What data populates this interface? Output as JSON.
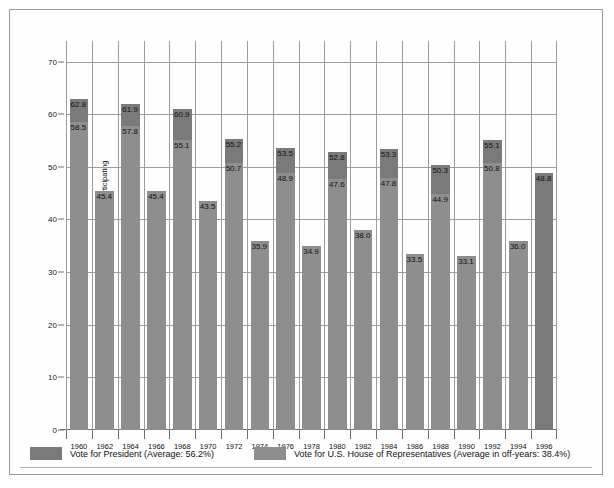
{
  "chart_data": {
    "type": "bar",
    "title": "",
    "xlabel": "",
    "ylabel": "Percentage of voting-age population participating",
    "ylim": [
      0,
      73.9
    ],
    "yticks": [
      0,
      10,
      20,
      30,
      40,
      50,
      60,
      70
    ],
    "grid": "both",
    "legend_position": "bottom-left",
    "categories": [
      "1960",
      "1962",
      "1964",
      "1966",
      "1968",
      "1970",
      "1972",
      "1974",
      "1976",
      "1978",
      "1980",
      "1982",
      "1984",
      "1986",
      "1988",
      "1990",
      "1992",
      "1994",
      "1996"
    ],
    "series": [
      {
        "name": "Vote for President (Average: 56.2%)",
        "color": "#7a7a7a",
        "values": [
          62.8,
          null,
          61.9,
          null,
          60.9,
          null,
          55.2,
          null,
          53.5,
          null,
          52.8,
          null,
          53.3,
          null,
          50.3,
          null,
          55.1,
          null,
          48.8
        ]
      },
      {
        "name": "Vote for U.S. House of Representatives (Average in off-years: 38.4%)",
        "color": "#8e8e8e",
        "values": [
          58.5,
          45.4,
          57.8,
          45.4,
          55.1,
          43.5,
          50.7,
          35.9,
          48.9,
          34.9,
          47.6,
          38.0,
          47.8,
          33.5,
          44.9,
          33.1,
          50.8,
          36.0,
          null
        ]
      }
    ],
    "bars": [
      {
        "year": "1960",
        "president": 62.8,
        "house": 58.5
      },
      {
        "year": "1962",
        "president": null,
        "house": 45.4
      },
      {
        "year": "1964",
        "president": 61.9,
        "house": 57.8
      },
      {
        "year": "1966",
        "president": null,
        "house": 45.4
      },
      {
        "year": "1968",
        "president": 60.9,
        "house": 55.1
      },
      {
        "year": "1970",
        "president": null,
        "house": 43.5
      },
      {
        "year": "1972",
        "president": 55.2,
        "house": 50.7
      },
      {
        "year": "1974",
        "president": null,
        "house": 35.9
      },
      {
        "year": "1976",
        "president": 53.5,
        "house": 48.9
      },
      {
        "year": "1978",
        "president": null,
        "house": 34.9
      },
      {
        "year": "1980",
        "president": 52.8,
        "house": 47.6
      },
      {
        "year": "1982",
        "president": null,
        "house": 38.0
      },
      {
        "year": "1984",
        "president": 53.3,
        "house": 47.8
      },
      {
        "year": "1986",
        "president": null,
        "house": 33.5
      },
      {
        "year": "1988",
        "president": 50.3,
        "house": 44.9
      },
      {
        "year": "1990",
        "president": null,
        "house": 33.1
      },
      {
        "year": "1992",
        "president": 55.1,
        "house": 50.8
      },
      {
        "year": "1994",
        "president": null,
        "house": 36.0
      },
      {
        "year": "1996",
        "president": 48.8,
        "house": null
      }
    ]
  },
  "legend": {
    "items": [
      {
        "label": "Vote for President (Average: 56.2%)",
        "color": "#7a7a7a"
      },
      {
        "label": "Vote for U.S. House of Representatives (Average in off-years: 38.4%)",
        "color": "#8e8e8e"
      }
    ]
  },
  "colors": {
    "president": "#7a7a7a",
    "house": "#8e8e8e",
    "grid": "#9c9c9c",
    "axis": "#6f6f6f",
    "frame": "#9a9a9a",
    "text": "#111111",
    "background": "#ffffff"
  }
}
